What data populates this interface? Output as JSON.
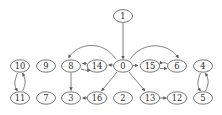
{
  "diagram": {
    "type": "directed-graph",
    "canvas": {
      "width": 222,
      "height": 115,
      "background": "#ffffff"
    },
    "style": {
      "node_fill": "#ffffff",
      "node_stroke": "#555555",
      "edge_color": "#6b6b6b",
      "label_color": "#2b2b2b",
      "node_rx": 9.5,
      "node_ry": 6.2
    },
    "nodes": [
      {
        "id": "1",
        "label": "1",
        "x": 123,
        "y": 16
      },
      {
        "id": "10",
        "label": "10",
        "x": 20,
        "y": 66
      },
      {
        "id": "9",
        "label": "9",
        "x": 46,
        "y": 66
      },
      {
        "id": "8",
        "label": "8",
        "x": 71,
        "y": 66
      },
      {
        "id": "14",
        "label": "14",
        "x": 97,
        "y": 66
      },
      {
        "id": "0",
        "label": "0",
        "x": 123,
        "y": 66
      },
      {
        "id": "15",
        "label": "15",
        "x": 150,
        "y": 66
      },
      {
        "id": "6",
        "label": "6",
        "x": 177,
        "y": 66
      },
      {
        "id": "4",
        "label": "4",
        "x": 203,
        "y": 66
      },
      {
        "id": "11",
        "label": "11",
        "x": 20,
        "y": 98
      },
      {
        "id": "7",
        "label": "7",
        "x": 46,
        "y": 98
      },
      {
        "id": "3",
        "label": "3",
        "x": 71,
        "y": 98
      },
      {
        "id": "16",
        "label": "16",
        "x": 97,
        "y": 98
      },
      {
        "id": "2",
        "label": "2",
        "x": 123,
        "y": 98
      },
      {
        "id": "13",
        "label": "13",
        "x": 150,
        "y": 98
      },
      {
        "id": "12",
        "label": "12",
        "x": 177,
        "y": 98
      },
      {
        "id": "5",
        "label": "5",
        "x": 203,
        "y": 98
      }
    ],
    "edges": [
      {
        "from": "1",
        "to": "0",
        "shape": "straight"
      },
      {
        "from": "0",
        "to": "14",
        "shape": "straight"
      },
      {
        "from": "14",
        "to": "8",
        "shape": "straight"
      },
      {
        "from": "8",
        "to": "14",
        "shape": "curve-below"
      },
      {
        "from": "0",
        "to": "8",
        "shape": "arc-above"
      },
      {
        "from": "0",
        "to": "15",
        "shape": "straight"
      },
      {
        "from": "15",
        "to": "6",
        "shape": "straight"
      },
      {
        "from": "6",
        "to": "15",
        "shape": "curve-below"
      },
      {
        "from": "0",
        "to": "6",
        "shape": "arc-above"
      },
      {
        "from": "8",
        "to": "3",
        "shape": "straight"
      },
      {
        "from": "0",
        "to": "16",
        "shape": "straight"
      },
      {
        "from": "16",
        "to": "3",
        "shape": "straight"
      },
      {
        "from": "0",
        "to": "13",
        "shape": "straight"
      },
      {
        "from": "13",
        "to": "12",
        "shape": "straight"
      },
      {
        "from": "10",
        "to": "11",
        "shape": "curve-left"
      },
      {
        "from": "11",
        "to": "10",
        "shape": "curve-right"
      },
      {
        "from": "4",
        "to": "5",
        "shape": "curve-left"
      },
      {
        "from": "5",
        "to": "4",
        "shape": "curve-right"
      }
    ],
    "isolated_nodes": [
      "9",
      "7",
      "2"
    ]
  }
}
